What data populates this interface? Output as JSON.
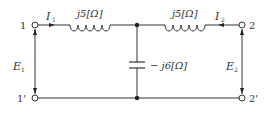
{
  "diagram": {
    "type": "two-port T-network circuit",
    "colors": {
      "line": "#333333",
      "background": "#ffffff"
    },
    "terminals": {
      "t1": "1",
      "t1_prime": "1'",
      "t2": "2",
      "t2_prime": "2'"
    },
    "currents": {
      "i1": "I",
      "i1_sub": "1",
      "i2": "I",
      "i2_sub": "2"
    },
    "voltages": {
      "e1": "E",
      "e1_sub": "1",
      "e2": "E",
      "e2_sub": "2"
    },
    "components": {
      "left_inductor": "j5[Ω]",
      "right_inductor": "j5[Ω]",
      "shunt_capacitor": "− j6[Ω]"
    }
  }
}
